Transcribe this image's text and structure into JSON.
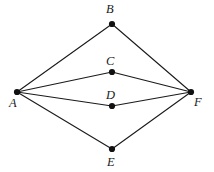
{
  "figure": {
    "type": "graph-diagram",
    "background_color": "#ffffff",
    "edge_color": "#1a1a1a",
    "vertex_color": "#111111",
    "label_color": "#1a1a1a",
    "vertices": [
      {
        "id": "A",
        "label": "A",
        "x": 17,
        "y": 92,
        "label_x": 9,
        "label_y": 97,
        "dot_r": 3.1
      },
      {
        "id": "B",
        "label": "B",
        "x": 112,
        "y": 24,
        "label_x": 106,
        "label_y": 3,
        "dot_r": 3.1
      },
      {
        "id": "C",
        "label": "C",
        "x": 112,
        "y": 72,
        "label_x": 106,
        "label_y": 55,
        "dot_r": 3.1
      },
      {
        "id": "D",
        "label": "D",
        "x": 112,
        "y": 106,
        "label_x": 106,
        "label_y": 89,
        "dot_r": 3.1
      },
      {
        "id": "E",
        "label": "E",
        "x": 112,
        "y": 149,
        "label_x": 107,
        "label_y": 156,
        "dot_r": 3.1
      },
      {
        "id": "F",
        "label": "F",
        "x": 191,
        "y": 92,
        "label_x": 194,
        "label_y": 96,
        "dot_r": 3.1
      }
    ],
    "edges": [
      {
        "from": "A",
        "to": "B"
      },
      {
        "from": "A",
        "to": "C"
      },
      {
        "from": "A",
        "to": "D"
      },
      {
        "from": "A",
        "to": "E"
      },
      {
        "from": "B",
        "to": "F"
      },
      {
        "from": "C",
        "to": "F"
      },
      {
        "from": "D",
        "to": "F"
      },
      {
        "from": "E",
        "to": "F"
      }
    ]
  }
}
